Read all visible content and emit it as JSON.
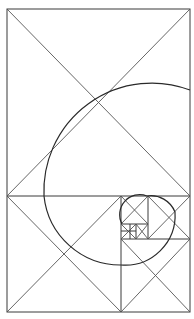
{
  "diagram": {
    "colors": {
      "line": "#3a3a3a",
      "background": "#ffffff"
    },
    "outer_rect": {
      "x": 7,
      "y": 9,
      "w": 183,
      "h": 303
    },
    "squares": [
      {
        "x": 7,
        "y": 9,
        "s": 187,
        "w": 183,
        "h": 187
      },
      {
        "x": 7,
        "y": 196,
        "w": 114,
        "h": 116
      },
      {
        "x": 121,
        "y": 239,
        "w": 69,
        "h": 73
      },
      {
        "x": 148,
        "y": 196,
        "w": 42,
        "h": 43
      },
      {
        "x": 121,
        "y": 196,
        "w": 27,
        "h": 28
      },
      {
        "x": 121,
        "y": 224,
        "w": 15,
        "h": 15
      },
      {
        "x": 136,
        "y": 224,
        "w": 12,
        "h": 15
      }
    ],
    "spiral_arcs": [
      {
        "cx": 190,
        "cy": 196,
        "r": 125,
        "from": "top-square-right-mid",
        "note": "large arc top"
      },
      {
        "d": "M190,70 A125,125 0 0 0 65,196 A116,116 0 0 0 121,312"
      }
    ]
  }
}
